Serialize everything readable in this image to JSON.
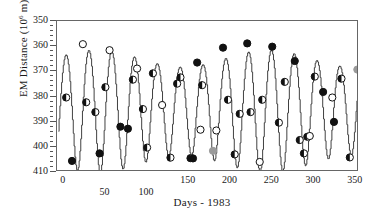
{
  "chart_data": {
    "type": "line",
    "title": "",
    "xlabel": "Days - 1983",
    "ylabel_text": "EM Distance (10",
    "ylabel_sup": "6",
    "ylabel_tail": " m)",
    "ylabel_plain": "EM Distance (10^6 m)",
    "grid": false,
    "legend": "none",
    "y_inverted": true,
    "xlim": [
      -8,
      354
    ],
    "ylim": [
      350,
      410
    ],
    "yticks": [
      350,
      360,
      370,
      380,
      390,
      400,
      410
    ],
    "ytick_labels": [
      "350",
      "360",
      "370",
      "380",
      "390",
      "400",
      "410"
    ],
    "y_minor_step": 2,
    "xticks": [
      0,
      50,
      100,
      150,
      200,
      250,
      300,
      350
    ],
    "xtick_labels": [
      "0",
      "50",
      "100",
      "150",
      "200",
      "250",
      "300",
      "350"
    ],
    "xtick_label_offsets": [
      0,
      12,
      12,
      0,
      0,
      0,
      0,
      0
    ],
    "x_minor_step": 10,
    "line_color": "#2b2b2b",
    "marker_colors": {
      "filled": "#111111",
      "open": "#ffffff",
      "half": "#111111",
      "gray": "#9a9a9a",
      "edge": "#111111"
    },
    "curve": {
      "description": "Earth-Moon distance, stepped sinusoid, anomalistic lunar period",
      "period_days": 27.35,
      "mean": 384.4,
      "amplitude": 21.0,
      "phase_days": 3.0,
      "envelope_period_days": 205.0,
      "envelope_amplitude": 3.4,
      "envelope_phase_days": 40.0,
      "step_days": 1.0,
      "sample_step_days": 0.5,
      "x_start": -6,
      "x_end": 352
    },
    "series": [
      {
        "name": "EM Distance observations",
        "points": [
          {
            "x": 3,
            "y": 380.4,
            "m": "half"
          },
          {
            "x": 10,
            "y": 405.6,
            "m": "filled"
          },
          {
            "x": 23,
            "y": 359.2,
            "m": "open"
          },
          {
            "x": 27,
            "y": 382.3,
            "m": "half"
          },
          {
            "x": 38,
            "y": 386.2,
            "m": "half"
          },
          {
            "x": 43,
            "y": 402.6,
            "m": "filled"
          },
          {
            "x": 50,
            "y": 376.3,
            "m": "half"
          },
          {
            "x": 55,
            "y": 361.6,
            "m": "open"
          },
          {
            "x": 68,
            "y": 392.0,
            "m": "filled"
          },
          {
            "x": 77,
            "y": 392.8,
            "m": "filled"
          },
          {
            "x": 83,
            "y": 373.3,
            "m": "half"
          },
          {
            "x": 88,
            "y": 368.9,
            "m": "open"
          },
          {
            "x": 95,
            "y": 385.0,
            "m": "half"
          },
          {
            "x": 100,
            "y": 400.3,
            "m": "half"
          },
          {
            "x": 107,
            "y": 370.8,
            "m": "half"
          },
          {
            "x": 118,
            "y": 383.4,
            "m": "open"
          },
          {
            "x": 128,
            "y": 404.3,
            "m": "half"
          },
          {
            "x": 136,
            "y": 374.9,
            "m": "half"
          },
          {
            "x": 140,
            "y": 372.4,
            "m": "half"
          },
          {
            "x": 152,
            "y": 404.5,
            "m": "half"
          },
          {
            "x": 155,
            "y": 404.6,
            "m": "filled"
          },
          {
            "x": 160,
            "y": 366.5,
            "m": "filled"
          },
          {
            "x": 166,
            "y": 375.5,
            "m": "half"
          },
          {
            "x": 164,
            "y": 393.2,
            "m": "open"
          },
          {
            "x": 179,
            "y": 401.6,
            "m": "gray"
          },
          {
            "x": 183,
            "y": 393.5,
            "m": "open"
          },
          {
            "x": 191,
            "y": 360.6,
            "m": "filled"
          },
          {
            "x": 197,
            "y": 381.3,
            "m": "half"
          },
          {
            "x": 205,
            "y": 403.0,
            "m": "half"
          },
          {
            "x": 211,
            "y": 386.9,
            "m": "half"
          },
          {
            "x": 220,
            "y": 358.9,
            "m": "filled"
          },
          {
            "x": 224,
            "y": 386.2,
            "m": "half"
          },
          {
            "x": 235,
            "y": 406.0,
            "m": "open"
          },
          {
            "x": 238,
            "y": 381.3,
            "m": "half"
          },
          {
            "x": 250,
            "y": 360.2,
            "m": "filled"
          },
          {
            "x": 258,
            "y": 390.4,
            "m": "half"
          },
          {
            "x": 265,
            "y": 374.2,
            "m": "half"
          },
          {
            "x": 277,
            "y": 365.9,
            "m": "filled"
          },
          {
            "x": 283,
            "y": 397.3,
            "m": "half"
          },
          {
            "x": 288,
            "y": 402.6,
            "m": "half"
          },
          {
            "x": 292,
            "y": 396.0,
            "m": "half"
          },
          {
            "x": 295,
            "y": 395.7,
            "m": "open"
          },
          {
            "x": 301,
            "y": 372.1,
            "m": "half"
          },
          {
            "x": 311,
            "y": 378.2,
            "m": "filled"
          },
          {
            "x": 322,
            "y": 380.4,
            "m": "open"
          },
          {
            "x": 324,
            "y": 390.1,
            "m": "filled"
          },
          {
            "x": 333,
            "y": 372.9,
            "m": "half"
          },
          {
            "x": 343,
            "y": 404.2,
            "m": "half"
          },
          {
            "x": 352,
            "y": 369.3,
            "m": "gray"
          },
          {
            "x": 359,
            "y": 377.2,
            "m": "half"
          }
        ]
      }
    ]
  }
}
